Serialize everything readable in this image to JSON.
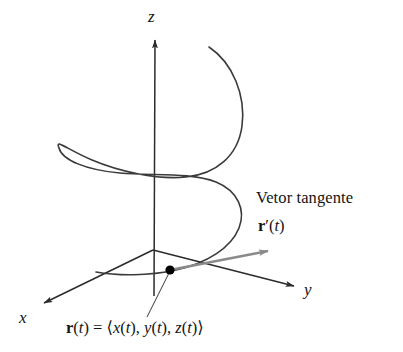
{
  "figure": {
    "kind": "vector-valued-function-helix-diagram",
    "background_color": "#ffffff",
    "curve_color": "#3a3a3a",
    "axis_color": "#2b2b2b",
    "tangent_color": "#8a8a8a",
    "point_color": "#000000"
  },
  "axes": {
    "z_label": "z",
    "x_label": "x",
    "y_label": "y"
  },
  "annotations": {
    "tangent_caption": "Vetor tangente",
    "tangent_symbol_r": "r",
    "tangent_symbol_prime": "′",
    "tangent_symbol_arg": "(t)",
    "equation_r": "r",
    "equation_arg": "(t)",
    "equation_equals": "=",
    "equation_open_angle": "⟨",
    "equation_x": "x",
    "equation_xarg": "(t),",
    "equation_y": "y",
    "equation_yarg": "(t),",
    "equation_z": "z",
    "equation_zarg": "(t)",
    "equation_close_angle": "⟩"
  },
  "geometry": {
    "origin": [
      153,
      250
    ],
    "point_on_curve": [
      170,
      270
    ],
    "z_axis_tip": [
      155,
      36
    ],
    "x_axis_tip": [
      41,
      305
    ],
    "y_axis_tip": [
      298,
      288
    ],
    "tangent_tip": [
      276,
      248
    ],
    "helix_top_end": [
      209,
      47
    ],
    "helix_bottom_end": [
      96,
      272
    ]
  }
}
